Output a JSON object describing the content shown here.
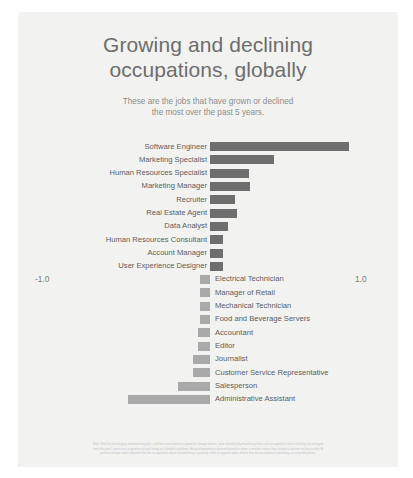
{
  "header": {
    "title_line1": "Growing and declining",
    "title_line2": "occupations, globally",
    "subtitle_line1": "These are the jobs that have grown or declined",
    "subtitle_line2": "the most over the past 5 years."
  },
  "axis": {
    "min_label": "-1.0",
    "max_label": "1.0"
  },
  "footnote": {
    "line1": "Note: This list of emerging and declining jobs, and their associated occupational change indices, were identified by monitoring how each occupation's share of hiring has changed",
    "line2": "over the past 5 years as a proportion of total hiring on LinkedIn's platform. Hiring information is gleaned based on when a member states they started a position on their profile. A",
    "line3": "positive change index indicates that the occupation's share of total hiring is growing, while a negative index means that the occupation is declining, on a monthly basis."
  },
  "colors": {
    "growing_bar": "#6e6e6e",
    "declining_bar": "#a9a9a9",
    "card_background": "#f2f2f0",
    "title_text": "#6d6d6d",
    "label_text": "#5d5d5d"
  },
  "chart_data": {
    "type": "bar",
    "orientation": "horizontal",
    "title": "Growing and declining occupations, globally",
    "subtitle": "These are the jobs that have grown or declined the most over the past 5 years.",
    "xlabel": "",
    "ylabel": "",
    "xlim": [
      -1.0,
      1.0
    ],
    "xticks": [
      -1.0,
      1.0
    ],
    "xticklabels": [
      "-1.0",
      "1.0"
    ],
    "grid": false,
    "legend": false,
    "categories": [
      "Software Engineer",
      "Marketing Specialist",
      "Human Resources Specialist",
      "Marketing Manager",
      "Recruiter",
      "Real Estate Agent",
      "Data Analyst",
      "Human Resources Consultant",
      "Account Manager",
      "User Experience Designer",
      "Electrical Technician",
      "Manager of Retail",
      "Mechanical Technician",
      "Food and Beverage Servers",
      "Accountant",
      "Editor",
      "Journalist",
      "Customer Service Representative",
      "Salesperson",
      "Administrative Assistant"
    ],
    "values": [
      0.83,
      0.38,
      0.23,
      0.24,
      0.15,
      0.16,
      0.11,
      0.08,
      0.08,
      0.08,
      -0.06,
      -0.06,
      -0.06,
      -0.06,
      -0.07,
      -0.07,
      -0.1,
      -0.1,
      -0.19,
      -0.49
    ]
  },
  "rows": [
    {
      "label": "Software Engineer",
      "value": 0.83,
      "side": "pos"
    },
    {
      "label": "Marketing Specialist",
      "value": 0.38,
      "side": "pos"
    },
    {
      "label": "Human Resources Specialist",
      "value": 0.23,
      "side": "pos"
    },
    {
      "label": "Marketing Manager",
      "value": 0.24,
      "side": "pos"
    },
    {
      "label": "Recruiter",
      "value": 0.15,
      "side": "pos"
    },
    {
      "label": "Real Estate Agent",
      "value": 0.16,
      "side": "pos"
    },
    {
      "label": "Data Analyst",
      "value": 0.11,
      "side": "pos"
    },
    {
      "label": "Human Resources Consultant",
      "value": 0.08,
      "side": "pos"
    },
    {
      "label": "Account Manager",
      "value": 0.08,
      "side": "pos"
    },
    {
      "label": "User Experience Designer",
      "value": 0.08,
      "side": "pos"
    },
    {
      "label": "Electrical Technician",
      "value": -0.06,
      "side": "neg"
    },
    {
      "label": "Manager of Retail",
      "value": -0.06,
      "side": "neg"
    },
    {
      "label": "Mechanical Technician",
      "value": -0.06,
      "side": "neg"
    },
    {
      "label": "Food and Beverage Servers",
      "value": -0.06,
      "side": "neg"
    },
    {
      "label": "Accountant",
      "value": -0.07,
      "side": "neg"
    },
    {
      "label": "Editor",
      "value": -0.07,
      "side": "neg"
    },
    {
      "label": "Journalist",
      "value": -0.1,
      "side": "neg"
    },
    {
      "label": "Customer Service Representative",
      "value": -0.1,
      "side": "neg"
    },
    {
      "label": "Salesperson",
      "value": -0.19,
      "side": "neg"
    },
    {
      "label": "Administrative Assistant",
      "value": -0.49,
      "side": "neg"
    }
  ]
}
